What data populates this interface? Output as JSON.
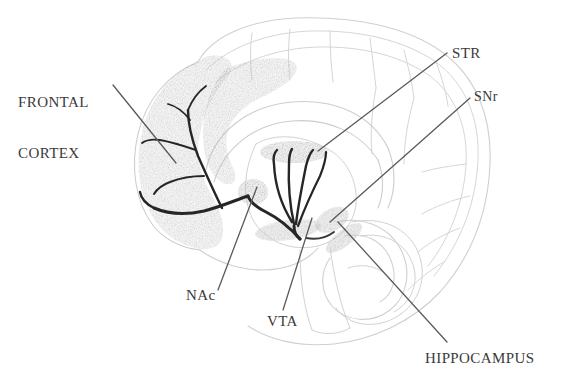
{
  "figure": {
    "type": "anatomical-diagram",
    "background_color": "#ffffff",
    "outline_color": "#c9c9c9",
    "shading_color": "#dcdcdc",
    "pathway_color": "#2b2b2b",
    "leader_color": "#5a5a5a",
    "label_color": "#3a3a3a"
  },
  "labels": [
    {
      "id": "frontal-cortex",
      "line1": "FRONTAL",
      "line2": "CORTEX",
      "x": 18,
      "y": 60
    },
    {
      "id": "str",
      "line1": "STR",
      "line2": "",
      "x": 452,
      "y": 45
    },
    {
      "id": "snr",
      "line1": "SNr",
      "line2": "",
      "x": 474,
      "y": 88
    },
    {
      "id": "nac",
      "line1": "NAc",
      "line2": "",
      "x": 186,
      "y": 287
    },
    {
      "id": "vta",
      "line1": "VTA",
      "line2": "",
      "x": 267,
      "y": 313
    },
    {
      "id": "hippocampus",
      "line1": "HIPPOCAMPUS",
      "line2": "",
      "x": 425,
      "y": 350
    }
  ],
  "regions": [
    {
      "id": "frontal-cortex-shading",
      "name": "frontal cortex"
    },
    {
      "id": "striatum-blob",
      "name": "striatum"
    },
    {
      "id": "nucleus-accumbens-blob",
      "name": "nucleus accumbens"
    },
    {
      "id": "vta-blob",
      "name": "ventral tegmental area"
    },
    {
      "id": "snr-blob",
      "name": "substantia nigra pars reticulata"
    },
    {
      "id": "hippocampus-outline",
      "name": "hippocampus"
    }
  ]
}
